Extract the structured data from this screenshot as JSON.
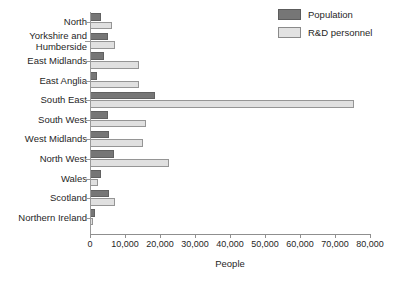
{
  "chart_data": {
    "type": "bar",
    "orientation": "horizontal",
    "title": "",
    "xlabel": "People",
    "ylabel": "",
    "xlim": [
      0,
      80000
    ],
    "xticks": [
      0,
      10000,
      20000,
      30000,
      40000,
      50000,
      60000,
      70000,
      80000
    ],
    "xtick_labels": [
      "0",
      "10,000",
      "20,000",
      "30,000",
      "40,000",
      "50,000",
      "60,000",
      "70,000",
      "80,000"
    ],
    "grid": false,
    "legend_position": "top-right",
    "categories": [
      "North",
      "Yorkshire and\nHumberside",
      "East Midlands",
      "East Anglia",
      "South East",
      "South West",
      "West Midlands",
      "North West",
      "Wales",
      "Scotland",
      "Northern Ireland"
    ],
    "series": [
      {
        "name": "Population",
        "color": "#767676",
        "values": [
          3000,
          5000,
          4000,
          2000,
          18500,
          5000,
          5500,
          6800,
          3000,
          5500,
          1500
        ]
      },
      {
        "name": "R&D personnel",
        "color": "#e0e0e0",
        "values": [
          6200,
          7200,
          14000,
          14000,
          75500,
          16000,
          15000,
          22500,
          2200,
          7200,
          900
        ]
      }
    ]
  },
  "legend": {
    "items": [
      {
        "label": "Population",
        "swatch": "dark"
      },
      {
        "label": "R&D personnel",
        "swatch": "light"
      }
    ]
  },
  "axis": {
    "x_title": "People"
  }
}
